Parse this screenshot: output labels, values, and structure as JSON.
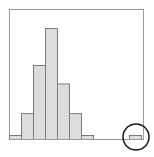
{
  "chart_data": {
    "type": "bar",
    "title": "",
    "xlabel": "",
    "ylabel": "",
    "categories": [
      "bin1",
      "bin2",
      "bin3",
      "bin4",
      "bin5",
      "bin6",
      "bin7",
      "bin8",
      "bin9",
      "bin10",
      "bin11"
    ],
    "values": [
      1,
      7,
      20,
      30,
      15,
      7,
      1,
      0,
      0,
      0,
      1
    ],
    "ylim": [
      0,
      35
    ],
    "grid": false,
    "legend": "none",
    "annotations": [
      {
        "type": "circle",
        "target_category": "bin11",
        "meaning": "outlier highlighted"
      }
    ]
  },
  "style": {
    "bar_fill": "#dcdcdc",
    "bar_stroke": "#7a7a7a",
    "frame_stroke": "#9a9a9a",
    "circle_stroke": "#1a1a1a"
  }
}
